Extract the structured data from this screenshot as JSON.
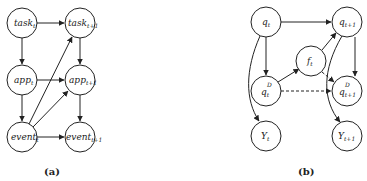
{
  "diagram_a": {
    "caption": "(a)",
    "nodes": [
      {
        "id": "task_t",
        "base": "task",
        "sub": "t",
        "x": 22,
        "y": 23
      },
      {
        "id": "task_t1",
        "base": "task",
        "sub": "t+1",
        "x": 80,
        "y": 23
      },
      {
        "id": "app_t",
        "base": "app",
        "sub": "t",
        "x": 22,
        "y": 80
      },
      {
        "id": "app_t1",
        "base": "app",
        "sub": "t+1",
        "x": 80,
        "y": 80
      },
      {
        "id": "event_t",
        "base": "event",
        "sub": "t",
        "x": 22,
        "y": 137
      },
      {
        "id": "event_t1",
        "base": "event",
        "sub": "t+1",
        "x": 80,
        "y": 137
      }
    ],
    "edges": [
      {
        "from": "task_t",
        "to": "task_t1",
        "style": "solid"
      },
      {
        "from": "task_t",
        "to": "app_t",
        "style": "solid"
      },
      {
        "from": "app_t",
        "to": "app_t1",
        "style": "solid"
      },
      {
        "from": "app_t",
        "to": "event_t",
        "style": "solid"
      },
      {
        "from": "event_t",
        "to": "event_t1",
        "style": "solid"
      },
      {
        "from": "event_t",
        "to": "task_t1",
        "style": "solid"
      },
      {
        "from": "event_t",
        "to": "app_t1",
        "style": "solid"
      },
      {
        "from": "task_t1",
        "to": "app_t1",
        "style": "solid"
      },
      {
        "from": "app_t1",
        "to": "event_t1",
        "style": "solid"
      }
    ]
  },
  "diagram_b": {
    "caption": "(b)",
    "nodes": [
      {
        "id": "q_t",
        "base": "q",
        "sub": "t",
        "sup": "",
        "x": 266,
        "y": 22
      },
      {
        "id": "q_t1",
        "base": "q",
        "sub": "t+1",
        "sup": "",
        "x": 347,
        "y": 22
      },
      {
        "id": "f_t",
        "base": "f",
        "sub": "t",
        "sup": "",
        "x": 311,
        "y": 61
      },
      {
        "id": "qD_t",
        "base": "q",
        "sub": "t",
        "sup": "D",
        "x": 266,
        "y": 91
      },
      {
        "id": "qD_t1",
        "base": "q",
        "sub": "t+1",
        "sup": "D",
        "x": 347,
        "y": 91
      },
      {
        "id": "Y_t",
        "base": "Y",
        "sub": "t",
        "sup": "",
        "x": 266,
        "y": 136
      },
      {
        "id": "Y_t1",
        "base": "Y",
        "sub": "t+1",
        "sup": "",
        "x": 347,
        "y": 136
      }
    ],
    "edges": [
      {
        "from": "q_t",
        "to": "q_t1",
        "style": "solid"
      },
      {
        "from": "q_t",
        "to": "qD_t",
        "style": "solid"
      },
      {
        "from": "q_t",
        "to": "Y_t",
        "style": "solid",
        "curved": true
      },
      {
        "from": "qD_t",
        "to": "f_t",
        "style": "solid"
      },
      {
        "from": "f_t",
        "to": "q_t1",
        "style": "solid"
      },
      {
        "from": "f_t",
        "to": "qD_t1",
        "style": "dashed"
      },
      {
        "from": "qD_t",
        "to": "qD_t1",
        "style": "dashed"
      },
      {
        "from": "q_t1",
        "to": "qD_t1",
        "style": "solid"
      },
      {
        "from": "q_t1",
        "to": "Y_t1",
        "style": "solid",
        "curved": true
      }
    ]
  }
}
